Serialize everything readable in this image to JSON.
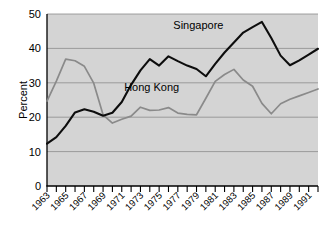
{
  "chart_data": {
    "type": "line",
    "title": "",
    "xlabel": "",
    "ylabel": "Percent",
    "ylim": [
      0,
      50
    ],
    "xlim": [
      1963,
      1992
    ],
    "yticks": [
      0,
      10,
      20,
      30,
      40,
      50
    ],
    "ytick_labels": [
      "0",
      "10",
      "20",
      "30",
      "40",
      "50"
    ],
    "xtick_labels": [
      "1963",
      "1965",
      "1967",
      "1969",
      "1971",
      "1973",
      "1975",
      "1977",
      "1979",
      "1981",
      "1983",
      "1985",
      "1987",
      "1989",
      "1991"
    ],
    "x": [
      1963,
      1964,
      1965,
      1966,
      1967,
      1968,
      1969,
      1970,
      1971,
      1972,
      1973,
      1974,
      1975,
      1976,
      1977,
      1978,
      1979,
      1980,
      1981,
      1982,
      1983,
      1984,
      1985,
      1986,
      1987,
      1988,
      1989,
      1990,
      1991,
      1992
    ],
    "grid": true,
    "legend_position": "inline-annotation",
    "series": [
      {
        "name": "Singapore",
        "color": "#0d0d0d",
        "label_position": {
          "x": 1979.2,
          "y": 45.5
        },
        "values": [
          12.3,
          14.2,
          17.5,
          21.4,
          22.3,
          21.6,
          20.4,
          21.3,
          24.4,
          29.4,
          33.6,
          36.9,
          35.0,
          37.7,
          36.3,
          35.0,
          34.0,
          31.9,
          35.5,
          38.8,
          41.7,
          44.6,
          46.2,
          47.7,
          43.0,
          37.9,
          35.1,
          36.5,
          38.2,
          39.9
        ]
      },
      {
        "name": "Hong Kong",
        "color": "#8a8a8a",
        "label_position": {
          "x": 1974.2,
          "y": 27.6
        },
        "values": [
          24.7,
          30.5,
          36.9,
          36.4,
          34.8,
          29.9,
          20.7,
          18.3,
          19.4,
          20.3,
          22.9,
          22.0,
          22.1,
          22.8,
          21.2,
          20.8,
          20.7,
          25.5,
          30.4,
          32.4,
          33.9,
          30.8,
          29.0,
          24.0,
          21.0,
          23.9,
          25.2,
          26.2,
          27.2,
          28.2
        ]
      }
    ]
  }
}
